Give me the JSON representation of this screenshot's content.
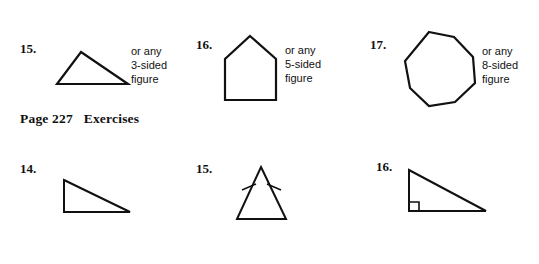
{
  "page": {
    "background_color": "#ffffff",
    "ink_color": "#111111",
    "section_heading": "Page 227   Exercises"
  },
  "top_row": {
    "items": [
      {
        "number": "15.",
        "note_lines": [
          "or any",
          "3-sided",
          "figure"
        ],
        "note_text": "or any\n3-sided\nfigure",
        "shape": "triangle",
        "sides": 3
      },
      {
        "number": "16.",
        "note_lines": [
          "or any",
          "5-sided",
          "figure"
        ],
        "note_text": "or any\n5-sided\nfigure",
        "shape": "pentagon",
        "sides": 5
      },
      {
        "number": "17.",
        "note_lines": [
          "or any",
          "8-sided",
          "figure"
        ],
        "note_text": "or any\n8-sided\nfigure",
        "shape": "octagon",
        "sides": 8
      }
    ]
  },
  "bottom_row": {
    "items": [
      {
        "number": "14.",
        "shape": "right-triangle",
        "markings": "none"
      },
      {
        "number": "15.",
        "shape": "isosceles-triangle",
        "markings": "congruent-tick-marks-on-two-legs"
      },
      {
        "number": "16.",
        "shape": "right-triangle",
        "markings": "right-angle-square-at-bottom-left"
      }
    ]
  }
}
